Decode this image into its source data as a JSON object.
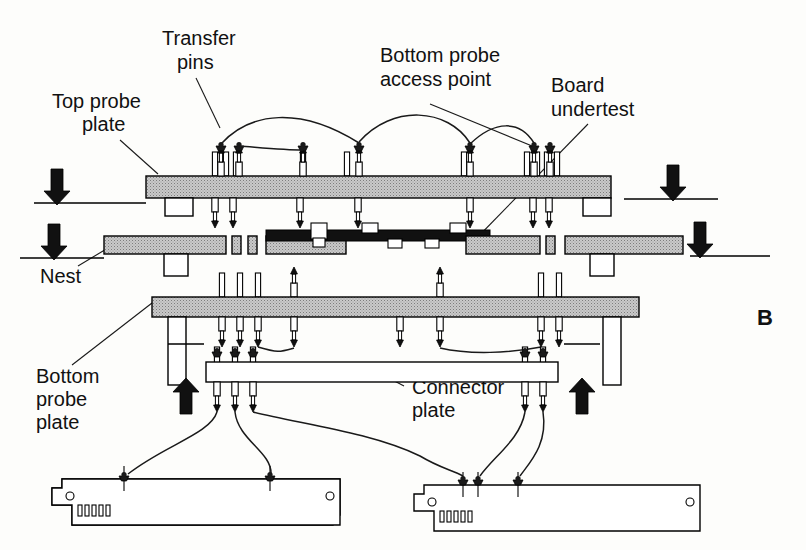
{
  "figure": {
    "panel_letter": "B",
    "background_color": "#fdfdfb",
    "ink_color": "#111111",
    "plate_fill_color": "#b0b0b0",
    "board_fill_color": "#111111",
    "plate_hatch": "stipple-gray"
  },
  "labels": {
    "transfer_pins": "Transfer\npins",
    "transfer_pins_line1": "Transfer",
    "transfer_pins_line2": "pins",
    "top_probe_plate_line1": "Top probe",
    "top_probe_plate_line2": "plate",
    "bottom_probe_access_line1": "Bottom probe",
    "bottom_probe_access_line2": "access point",
    "board_undertest_line1": "Board",
    "board_undertest_line2": "undertest",
    "nest": "Nest",
    "bottom_probe_plate_line1": "Bottom",
    "bottom_probe_plate_line2": "probe",
    "bottom_probe_plate_line3": "plate",
    "connector_plate_line1": "Connector",
    "connector_plate_line2": "plate"
  },
  "components": [
    {
      "name": "top-probe-plate",
      "label": "Top probe plate",
      "kind": "plate",
      "fill": "#b0b0b0"
    },
    {
      "name": "nest",
      "label": "Nest",
      "kind": "plate",
      "fill": "#b0b0b0"
    },
    {
      "name": "board-undertest",
      "label": "Board undertest",
      "kind": "pcb",
      "fill": "#111111"
    },
    {
      "name": "bottom-probe-plate",
      "label": "Bottom probe plate",
      "kind": "plate",
      "fill": "#b0b0b0"
    },
    {
      "name": "connector-plate",
      "label": "Connector plate",
      "kind": "plate",
      "fill": "#ffffff"
    },
    {
      "name": "transfer-pins",
      "label": "Transfer pins",
      "kind": "pins"
    },
    {
      "name": "bottom-probe-access-point",
      "label": "Bottom probe access point",
      "kind": "access-point"
    },
    {
      "name": "interface-board-left",
      "label": "Interface board (left)",
      "kind": "pcb-card"
    },
    {
      "name": "interface-board-right",
      "label": "Interface board (right)",
      "kind": "pcb-card"
    }
  ],
  "force_arrows": [
    {
      "name": "force-arrow-top-left",
      "direction": "down",
      "x": 82,
      "y": 155
    },
    {
      "name": "force-arrow-top-right",
      "direction": "down",
      "x": 672,
      "y": 150
    },
    {
      "name": "force-arrow-mid-left",
      "direction": "down",
      "x": 54,
      "y": 230
    },
    {
      "name": "force-arrow-mid-right",
      "direction": "down",
      "x": 700,
      "y": 228
    },
    {
      "name": "force-arrow-bottom-left",
      "direction": "up",
      "x": 186,
      "y": 375
    },
    {
      "name": "force-arrow-bottom-right",
      "direction": "up",
      "x": 581,
      "y": 375
    }
  ],
  "top_plate_pins": {
    "above_x": [
      215,
      234,
      298,
      359,
      470,
      535,
      549
    ],
    "below_x": [
      215,
      234,
      298,
      359,
      470,
      535,
      549
    ]
  },
  "bottom_plate_pins": {
    "above_x": [
      222,
      240,
      258,
      294,
      400,
      440,
      542,
      560
    ],
    "below_x": [
      222,
      240,
      258,
      294,
      400,
      440,
      542,
      560
    ]
  },
  "connector_plate_pins": {
    "above_x": [
      217,
      235,
      253,
      525,
      545
    ],
    "below_x": [
      217,
      235,
      253,
      525,
      545
    ]
  }
}
